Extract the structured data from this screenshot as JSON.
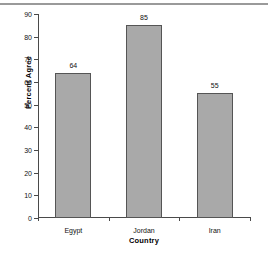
{
  "chart_data": {
    "type": "bar",
    "title": "",
    "subtitle": "",
    "categories": [
      "Egypt",
      "Jordan",
      "Iran"
    ],
    "values": [
      64,
      85,
      55
    ],
    "value_labels": [
      "64",
      "85",
      "55"
    ],
    "xlabel": "Country",
    "ylabel": "Percent Agree",
    "ylim": [
      0,
      90
    ],
    "ytick_labels": [
      "0",
      "10",
      "20",
      "30",
      "40",
      "50",
      "60",
      "70",
      "80",
      "90"
    ],
    "ytick_values": [
      0,
      10,
      20,
      30,
      40,
      50,
      60,
      70,
      80,
      90
    ],
    "grid": false,
    "legend": false,
    "legend_position": "none",
    "bar_fill_color": "#a9a9a9",
    "bar_border_color": "#555555",
    "axis_color": "#4a4a4a",
    "text_color": "#111111",
    "background_color": "#ffffff",
    "top_rule_color": "#9a9a9a"
  }
}
